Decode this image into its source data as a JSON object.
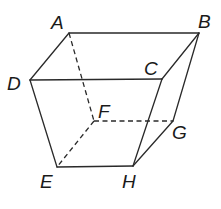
{
  "figure": {
    "type": "3D solid (frustum-like hexahedron) with hidden edges dashed",
    "vertices": {
      "A": {
        "label": "A",
        "x": 69,
        "y": 33,
        "lx": 51,
        "ly": 29
      },
      "B": {
        "label": "B",
        "x": 199,
        "y": 33,
        "lx": 198,
        "ly": 28
      },
      "C": {
        "label": "C",
        "x": 162,
        "y": 79,
        "lx": 144,
        "ly": 75
      },
      "D": {
        "label": "D",
        "x": 30,
        "y": 80,
        "lx": 7,
        "ly": 90
      },
      "E": {
        "label": "E",
        "x": 57,
        "y": 167,
        "lx": 40,
        "ly": 188
      },
      "F": {
        "label": "F",
        "x": 94,
        "y": 121,
        "lx": 98,
        "ly": 118
      },
      "G": {
        "label": "G",
        "x": 173,
        "y": 121,
        "lx": 172,
        "ly": 139
      },
      "H": {
        "label": "H",
        "x": 133,
        "y": 166,
        "lx": 122,
        "ly": 188
      }
    },
    "solid_edges": [
      "A-B",
      "A-D",
      "D-C",
      "C-B",
      "D-E",
      "E-H",
      "C-H",
      "B-G",
      "G-H"
    ],
    "hidden_edges": [
      "A-F",
      "F-G",
      "F-E"
    ]
  }
}
